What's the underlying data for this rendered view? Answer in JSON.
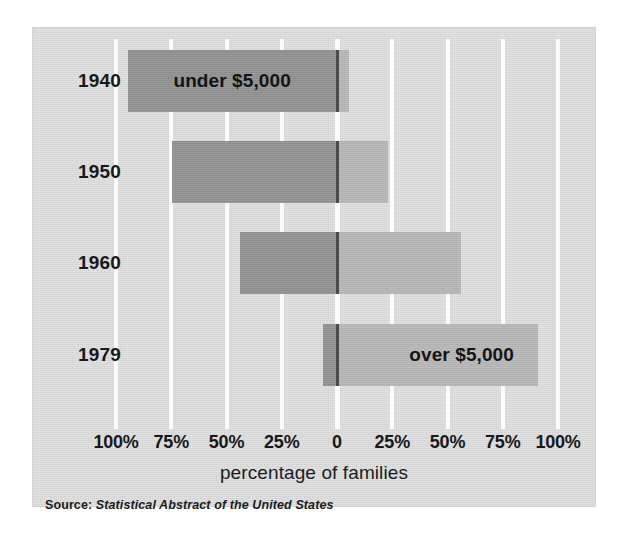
{
  "chart_data": {
    "type": "bar",
    "orientation": "horizontal",
    "subtype": "diverging-stacked",
    "title": "",
    "xlabel": "percentage of families",
    "ylabel": "",
    "categories": [
      "1940",
      "1950",
      "1960",
      "1979"
    ],
    "series": [
      {
        "name": "under $5,000",
        "color": "#949494",
        "values": [
          94.5,
          74.5,
          44.0,
          6.5
        ]
      },
      {
        "name": "over $5,000",
        "color": "#b9b9b9",
        "values": [
          5.5,
          23.0,
          56.0,
          91.0
        ]
      }
    ],
    "xlim": [
      -100,
      100
    ],
    "xticks": [
      -100,
      -75,
      -50,
      -25,
      0,
      25,
      50,
      75,
      100
    ],
    "xticklabels": [
      "100%",
      "75%",
      "50%",
      "25%",
      "0",
      "25%",
      "50%",
      "75%",
      "100%"
    ],
    "grid": true,
    "gridcolor": "#fbfbfb",
    "legend": "none",
    "annotations": [
      {
        "text": "under $5,000",
        "row": "1940",
        "side": "left"
      },
      {
        "text": "over $5,000",
        "row": "1979",
        "side": "right"
      }
    ],
    "source": "Statistical Abstract of the United States",
    "background": "#dddddd"
  },
  "axis": {
    "ticks": [
      {
        "label": "100%",
        "value": -100
      },
      {
        "label": "75%",
        "value": -75
      },
      {
        "label": "50%",
        "value": -50
      },
      {
        "label": "25%",
        "value": -25
      },
      {
        "label": "0",
        "value": 0
      },
      {
        "label": "25%",
        "value": 25
      },
      {
        "label": "50%",
        "value": 50
      },
      {
        "label": "75%",
        "value": 75
      },
      {
        "label": "100%",
        "value": 100
      }
    ],
    "title": "percentage of families"
  },
  "rows": [
    {
      "year": "1940",
      "under": 94.5,
      "over": 5.5,
      "label": "under $5,000",
      "label_side": "under"
    },
    {
      "year": "1950",
      "under": 74.5,
      "over": 23.0,
      "label": "",
      "label_side": ""
    },
    {
      "year": "1960",
      "under": 44.0,
      "over": 56.0,
      "label": "",
      "label_side": ""
    },
    {
      "year": "1979",
      "under": 6.5,
      "over": 91.0,
      "label": "over $5,000",
      "label_side": "over"
    }
  ],
  "source": {
    "prefix": "Source:",
    "title": "Statistical Abstract of the United States"
  },
  "colors": {
    "under": "#949494",
    "over": "#b9b9b9",
    "panel": "#dddddd",
    "grid": "#fbfbfb",
    "text": "#18181a"
  }
}
